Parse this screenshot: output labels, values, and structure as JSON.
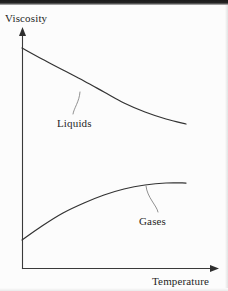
{
  "figure": {
    "background_color": "#fcfcfc",
    "line_color": "#333333",
    "axis_color": "#3a3a3a",
    "leader_color": "#7d7d7d",
    "text_color": "#1f1f1f"
  },
  "axes": {
    "y_title": "Viscosity",
    "x_title": "Temperature"
  },
  "series_labels": {
    "liquids": "Liquids",
    "gases": "Gases"
  },
  "chart_data": {
    "type": "line",
    "title": "",
    "subtitle": "",
    "xlabel": "Temperature",
    "ylabel": "Viscosity",
    "xlim": [
      0,
      1
    ],
    "ylim": [
      0,
      1
    ],
    "grid": false,
    "legend_position": "inline-annotations",
    "tick_labels": {
      "x": [],
      "y": []
    },
    "annotations": [
      {
        "text": "Liquids",
        "points_to_series": "Liquids",
        "label_xy_px": [
          57,
          124
        ],
        "leader_from_px": [
          80,
          92
        ],
        "leader_to_px": [
          73,
          114
        ]
      },
      {
        "text": "Gases",
        "points_to_series": "Gases",
        "label_xy_px": [
          139,
          222
        ],
        "leader_from_px": [
          146,
          186
        ],
        "leader_to_px": [
          158,
          212
        ]
      }
    ],
    "series": [
      {
        "name": "Liquids",
        "description": "Viscosity decreases with increasing temperature (convex, monotonically decreasing)",
        "x": [
          0.0,
          0.12,
          0.25,
          0.38,
          0.5,
          0.62,
          0.75,
          0.88,
          1.0
        ],
        "y": [
          0.92,
          0.85,
          0.78,
          0.72,
          0.67,
          0.63,
          0.6,
          0.58,
          0.57
        ],
        "x_px": [
          22,
          42,
          63,
          84,
          104,
          124,
          145,
          166,
          186
        ],
        "y_px": [
          48,
          59,
          70,
          81,
          92,
          103,
          112,
          119,
          124
        ]
      },
      {
        "name": "Gases",
        "description": "Viscosity increases with increasing temperature, flattening to a plateau (concave, monotonically increasing)",
        "x": [
          0.0,
          0.12,
          0.25,
          0.38,
          0.5,
          0.62,
          0.75,
          0.88,
          1.0
        ],
        "y": [
          0.12,
          0.2,
          0.27,
          0.31,
          0.34,
          0.36,
          0.365,
          0.368,
          0.368
        ],
        "x_px": [
          22,
          42,
          63,
          84,
          104,
          124,
          145,
          166,
          186
        ],
        "y_px": [
          240,
          226,
          213,
          203,
          195,
          189,
          185,
          183,
          183
        ]
      }
    ]
  }
}
